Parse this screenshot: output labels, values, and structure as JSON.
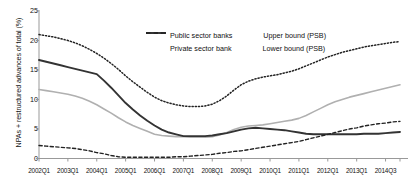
{
  "chart_data": {
    "type": "line",
    "title": "",
    "xlabel": "",
    "ylabel": "NPAs + restructured advances of total (%)",
    "ylim": [
      0,
      25
    ],
    "yticks": [
      0,
      5,
      10,
      15,
      20,
      25
    ],
    "grid": false,
    "legend_position": "top-center",
    "xtick_labels": [
      "2002Q1",
      "2003Q1",
      "2004Q1",
      "2005Q1",
      "2006Q1",
      "2007Q1",
      "2008Q1",
      "2009Q1",
      "2010Q1",
      "2011Q1",
      "2012Q1",
      "2013Q1",
      "2014Q3"
    ],
    "x": [
      "2002Q1",
      "2002Q2",
      "2002Q3",
      "2002Q4",
      "2003Q1",
      "2003Q2",
      "2003Q3",
      "2003Q4",
      "2004Q1",
      "2004Q2",
      "2004Q3",
      "2004Q4",
      "2005Q1",
      "2005Q2",
      "2005Q3",
      "2005Q4",
      "2006Q1",
      "2006Q2",
      "2006Q3",
      "2006Q4",
      "2007Q1",
      "2007Q2",
      "2007Q3",
      "2007Q4",
      "2008Q1",
      "2008Q2",
      "2008Q3",
      "2008Q4",
      "2009Q1",
      "2009Q2",
      "2009Q3",
      "2009Q4",
      "2010Q1",
      "2010Q2",
      "2010Q3",
      "2010Q4",
      "2011Q1",
      "2011Q2",
      "2011Q3",
      "2011Q4",
      "2012Q1",
      "2012Q2",
      "2012Q3",
      "2012Q4",
      "2013Q1",
      "2013Q2",
      "2013Q3",
      "2013Q4",
      "2014Q1",
      "2014Q2",
      "2014Q3"
    ],
    "series": [
      {
        "name": "Public sector banks",
        "style": "solid",
        "color": "#b0b0b0",
        "values": [
          11.7,
          11.5,
          11.3,
          11.1,
          10.9,
          10.6,
          10.2,
          9.7,
          9.1,
          8.4,
          7.7,
          6.9,
          6.2,
          5.6,
          5.1,
          4.6,
          4.1,
          3.9,
          3.8,
          3.7,
          3.7,
          3.6,
          3.6,
          3.6,
          3.7,
          4.0,
          4.4,
          4.9,
          5.3,
          5.5,
          5.6,
          5.7,
          5.9,
          6.1,
          6.3,
          6.5,
          6.8,
          7.3,
          7.9,
          8.5,
          9.1,
          9.6,
          10.0,
          10.4,
          10.7,
          11.0,
          11.3,
          11.6,
          11.9,
          12.2,
          12.5
        ]
      },
      {
        "name": "Private sector bank",
        "style": "solid",
        "color": "#333333",
        "values": [
          16.7,
          16.4,
          16.1,
          15.8,
          15.5,
          15.2,
          14.9,
          14.6,
          14.3,
          13.2,
          12.0,
          10.7,
          9.4,
          8.3,
          7.3,
          6.4,
          5.6,
          4.9,
          4.4,
          4.1,
          3.8,
          3.8,
          3.8,
          3.8,
          3.9,
          4.1,
          4.3,
          4.6,
          4.9,
          5.1,
          5.2,
          5.1,
          5.0,
          4.9,
          4.8,
          4.6,
          4.4,
          4.2,
          4.1,
          4.1,
          4.1,
          4.1,
          4.1,
          4.1,
          4.1,
          4.2,
          4.2,
          4.2,
          4.3,
          4.4,
          4.5
        ]
      },
      {
        "name": "Upper bound (PSB)",
        "style": "dotted",
        "color": "#222222",
        "values": [
          21.0,
          20.8,
          20.6,
          20.3,
          20.0,
          19.6,
          19.1,
          18.5,
          17.8,
          17.0,
          16.1,
          15.1,
          14.0,
          13.0,
          12.1,
          11.2,
          10.4,
          9.8,
          9.4,
          9.1,
          8.9,
          8.8,
          8.8,
          8.9,
          9.2,
          9.8,
          10.6,
          11.6,
          12.5,
          13.1,
          13.5,
          13.8,
          14.0,
          14.2,
          14.5,
          14.8,
          15.2,
          15.7,
          16.2,
          16.7,
          17.2,
          17.6,
          18.0,
          18.3,
          18.6,
          18.9,
          19.1,
          19.3,
          19.5,
          19.7,
          19.8
        ]
      },
      {
        "name": "Lower bound (PSB)",
        "style": "dashed",
        "color": "#222222",
        "values": [
          2.2,
          2.1,
          2.0,
          1.9,
          1.8,
          1.7,
          1.5,
          1.3,
          1.0,
          0.8,
          0.5,
          0.3,
          0.2,
          0.2,
          0.2,
          0.2,
          0.2,
          0.2,
          0.2,
          0.3,
          0.3,
          0.4,
          0.5,
          0.6,
          0.7,
          0.9,
          1.0,
          1.2,
          1.3,
          1.5,
          1.7,
          1.9,
          2.1,
          2.3,
          2.5,
          2.7,
          2.9,
          3.2,
          3.5,
          3.8,
          4.1,
          4.4,
          4.7,
          5.0,
          5.2,
          5.5,
          5.7,
          5.9,
          6.0,
          6.2,
          6.3
        ]
      }
    ]
  },
  "legend": {
    "items": [
      {
        "label": "Public sector banks"
      },
      {
        "label": "Upper bound (PSB)"
      },
      {
        "label": "Private sector bank"
      },
      {
        "label": "Lower bound (PSB)"
      }
    ]
  }
}
